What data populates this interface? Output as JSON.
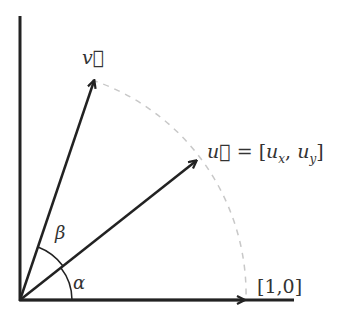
{
  "diagram": {
    "type": "vector-rotation",
    "labels": {
      "v": "v⃗",
      "u_lhs": "u⃗",
      "u_eq": " = [",
      "ux": "u",
      "ux_sub": "x",
      "comma": ", ",
      "uy": "u",
      "uy_sub": "y",
      "close": "]",
      "unit": "[1,0]",
      "alpha": "α",
      "beta": "β"
    },
    "vectors": [
      {
        "name": "v",
        "angle_deg": 72
      },
      {
        "name": "u",
        "angle_deg": 38
      },
      {
        "name": "[1,0]",
        "angle_deg": 0
      }
    ],
    "colors": {
      "stroke": "#222222",
      "arc_dashed": "#c8c8c8",
      "text": "#333333"
    }
  }
}
